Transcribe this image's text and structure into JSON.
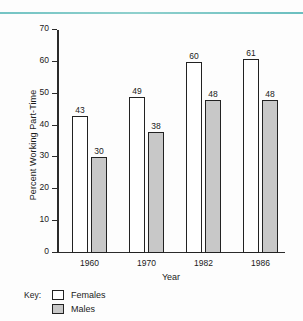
{
  "chart_data": {
    "type": "bar",
    "title": "",
    "xlabel": "Year",
    "ylabel": "Percent Working Part-Time",
    "categories": [
      "1960",
      "1970",
      "1982",
      "1986"
    ],
    "series": [
      {
        "name": "Females",
        "values": [
          43,
          49,
          60,
          61
        ],
        "color": "#ffffff"
      },
      {
        "name": "Males",
        "values": [
          30,
          38,
          48,
          48
        ],
        "color": "#c8c8c8"
      }
    ],
    "ylim": [
      0,
      70
    ],
    "yticks": [
      0,
      10,
      20,
      30,
      40,
      50,
      60,
      70
    ],
    "ytick_labels": [
      "0",
      "10",
      "20",
      "30",
      "40",
      "50",
      "60",
      "70"
    ],
    "grid": false,
    "legend_position": "bottom-left",
    "data_labels": true
  },
  "key": {
    "title": "Key:",
    "entries": [
      {
        "label": "Females"
      },
      {
        "label": "Males"
      }
    ]
  },
  "decoration": {
    "rule_color": "#74c4c4"
  }
}
